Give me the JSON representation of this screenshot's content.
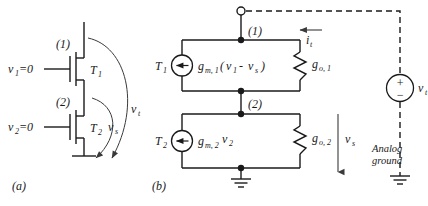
{
  "figure": {
    "panels": [
      {
        "id": "a",
        "label": "(a)"
      },
      {
        "id": "b",
        "label": "(b)"
      }
    ]
  },
  "panel_a": {
    "node_labels": {
      "node1": "(1)",
      "node2": "(2)"
    },
    "transistors": [
      {
        "name": "T_1",
        "base": "T",
        "sub": "1",
        "gate_label_base": "v",
        "gate_label_sub": "1",
        "gate_label_tail": "=0"
      },
      {
        "name": "T_2",
        "base": "T",
        "sub": "2",
        "gate_label_base": "v",
        "gate_label_sub": "2",
        "gate_label_tail": "=0"
      }
    ],
    "gate_labels": [
      {
        "base": "v",
        "sub": "1",
        "tail": "=0"
      },
      {
        "base": "v",
        "sub": "2",
        "tail": "=0"
      }
    ],
    "arrows": [
      {
        "name": "v_t",
        "base": "v",
        "sub": "t"
      },
      {
        "name": "v_s",
        "base": "v",
        "sub": "s"
      }
    ]
  },
  "panel_b": {
    "node_labels": {
      "node1": "(1)",
      "node2": "(2)"
    },
    "sources": [
      {
        "device": "T",
        "device_sub": "1",
        "expr_base": "g",
        "expr_sub": "m, 1",
        "expr_paren_open": "(",
        "expr_v1_base": "v",
        "expr_v1_sub": "1",
        "expr_minus": "-",
        "expr_vs_base": "v",
        "expr_vs_sub": "s",
        "expr_paren_close": ")"
      },
      {
        "device": "T",
        "device_sub": "2",
        "expr_base": "g",
        "expr_sub": "m, 2",
        "expr_v_base": "v",
        "expr_v_sub": "2"
      }
    ],
    "conductances": [
      {
        "base": "g",
        "sub": "o, 1"
      },
      {
        "base": "g",
        "sub": "o, 2"
      }
    ],
    "test_current": {
      "base": "i",
      "sub": "t"
    },
    "test_voltage": {
      "base": "v",
      "sub": "t"
    },
    "source_polarity": {
      "plus": "+",
      "minus": "−"
    },
    "node_voltage": {
      "base": "v",
      "sub": "s"
    },
    "ground_label_line1": "Analog",
    "ground_label_line2": "ground"
  },
  "colors": {
    "ink": "#1a1a1a",
    "soft_ink": "#3a3a3a",
    "background": "#ffffff"
  }
}
